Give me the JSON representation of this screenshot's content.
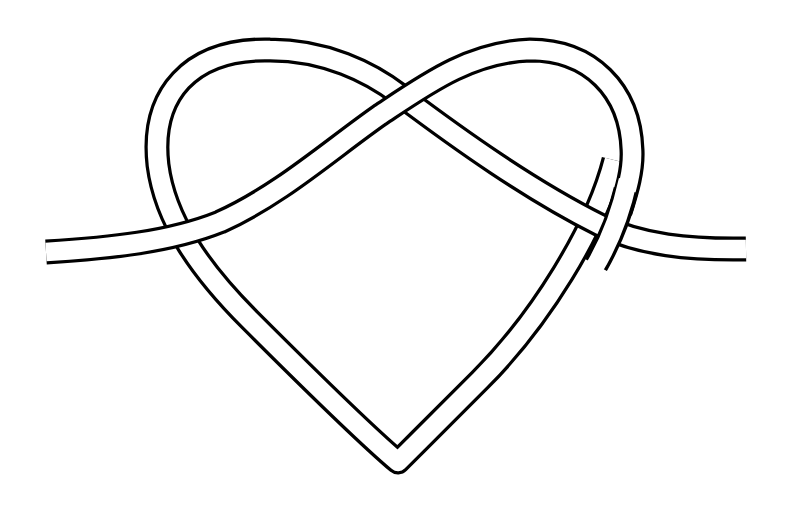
{
  "image": {
    "subject": "heart-shaped knot line drawing",
    "description": "A single double-outlined ribbon tied into a heart-shaped knot, with two loose ends extending horizontally to the left and right.",
    "width": 794,
    "height": 517
  },
  "style": {
    "background": "#ffffff",
    "stroke_color": "#000000",
    "ribbon_fill": "#ffffff"
  },
  "elements": {
    "left_tail": "Ribbon end extending to the left edge, passing over the left side of the heart",
    "left_lobe": "Left rounded lobe of the heart",
    "crossing": "Ribbon crossing at the top center of the heart",
    "right_lobe": "Right rounded lobe of the heart",
    "right_tail": "Ribbon end extending to the right edge, passing under the right side of the heart",
    "bottom_point": "Pointed bottom tip of the heart"
  }
}
